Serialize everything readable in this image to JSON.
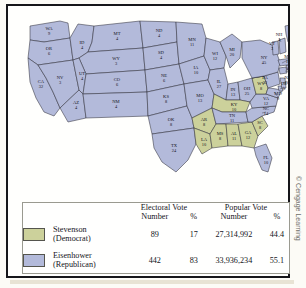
{
  "figure": {
    "credit": "© Cengage Learning"
  },
  "map": {
    "type": "us-electoral-map",
    "dem_color": "#ccd19b",
    "rep_color": "#b3bada",
    "states": [
      {
        "code": "WA",
        "votes": "9",
        "party": "rep"
      },
      {
        "code": "OR",
        "votes": "6",
        "party": "rep"
      },
      {
        "code": "CA",
        "votes": "32",
        "party": "rep"
      },
      {
        "code": "NV",
        "votes": "3",
        "party": "rep"
      },
      {
        "code": "ID",
        "votes": "4",
        "party": "rep"
      },
      {
        "code": "MT",
        "votes": "4",
        "party": "rep"
      },
      {
        "code": "WY",
        "votes": "3",
        "party": "rep"
      },
      {
        "code": "UT",
        "votes": "4",
        "party": "rep"
      },
      {
        "code": "AZ",
        "votes": "4",
        "party": "rep"
      },
      {
        "code": "CO",
        "votes": "6",
        "party": "rep"
      },
      {
        "code": "NM",
        "votes": "4",
        "party": "rep"
      },
      {
        "code": "ND",
        "votes": "4",
        "party": "rep"
      },
      {
        "code": "SD",
        "votes": "4",
        "party": "rep"
      },
      {
        "code": "NE",
        "votes": "6",
        "party": "rep"
      },
      {
        "code": "KS",
        "votes": "8",
        "party": "rep"
      },
      {
        "code": "OK",
        "votes": "8",
        "party": "rep"
      },
      {
        "code": "TX",
        "votes": "24",
        "party": "rep"
      },
      {
        "code": "MN",
        "votes": "11",
        "party": "rep"
      },
      {
        "code": "IA",
        "votes": "10",
        "party": "rep"
      },
      {
        "code": "MO",
        "votes": "13",
        "party": "rep"
      },
      {
        "code": "AR",
        "votes": "8",
        "party": "dem"
      },
      {
        "code": "LA",
        "votes": "10",
        "party": "dem"
      },
      {
        "code": "WI",
        "votes": "12",
        "party": "rep"
      },
      {
        "code": "IL",
        "votes": "27",
        "party": "rep"
      },
      {
        "code": "MI",
        "votes": "20",
        "party": "rep"
      },
      {
        "code": "IN",
        "votes": "13",
        "party": "rep"
      },
      {
        "code": "OH",
        "votes": "25",
        "party": "rep"
      },
      {
        "code": "KY",
        "votes": "10",
        "party": "dem"
      },
      {
        "code": "TN",
        "votes": "11",
        "party": "rep"
      },
      {
        "code": "MS",
        "votes": "8",
        "party": "dem"
      },
      {
        "code": "AL",
        "votes": "11",
        "party": "dem"
      },
      {
        "code": "GA",
        "votes": "12",
        "party": "dem"
      },
      {
        "code": "FL",
        "votes": "10",
        "party": "rep"
      },
      {
        "code": "SC",
        "votes": "8",
        "party": "dem"
      },
      {
        "code": "NC",
        "votes": "14",
        "party": "rep"
      },
      {
        "code": "VA",
        "votes": "12",
        "party": "rep"
      },
      {
        "code": "WV",
        "votes": "8",
        "party": "dem"
      },
      {
        "code": "MD",
        "votes": "9",
        "party": "rep"
      },
      {
        "code": "DE",
        "votes": "3",
        "party": "rep"
      },
      {
        "code": "PA",
        "votes": "32",
        "party": "rep"
      },
      {
        "code": "NJ",
        "votes": "16",
        "party": "rep"
      },
      {
        "code": "NY",
        "votes": "45",
        "party": "rep"
      },
      {
        "code": "CT",
        "votes": "8",
        "party": "rep"
      },
      {
        "code": "RI",
        "votes": "4",
        "party": "rep"
      },
      {
        "code": "MA",
        "votes": "16",
        "party": "rep"
      },
      {
        "code": "VT",
        "votes": "3",
        "party": "rep"
      },
      {
        "code": "NH",
        "votes": "4",
        "party": "rep"
      },
      {
        "code": "ME",
        "votes": "5",
        "party": "rep"
      }
    ]
  },
  "legend": {
    "group_headers": {
      "electoral": "Electoral Vote",
      "popular": "Popular Vote"
    },
    "col_headers": {
      "number": "Number",
      "percent": "%"
    },
    "rows": [
      {
        "candidate": "Stevenson",
        "party": "(Democrat)",
        "electoral_number": "89",
        "electoral_pct": "17",
        "popular_number": "27,314,992",
        "popular_pct": "44.4"
      },
      {
        "candidate": "Eisenhower",
        "party": "(Republican)",
        "electoral_number": "442",
        "electoral_pct": "83",
        "popular_number": "33,936,234",
        "popular_pct": "55.1"
      }
    ]
  }
}
